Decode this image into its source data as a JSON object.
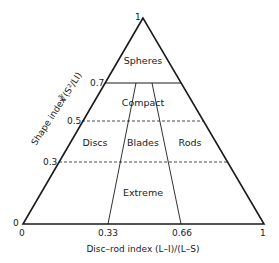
{
  "diagram": {
    "type": "ternary-form-diagram",
    "apex_label": "1",
    "origin_y_label": "0",
    "origin_x_label": "0",
    "y_axis": {
      "title": "Shape index",
      "formula": "∛(S²/LI)",
      "ticks": [
        {
          "value": 0.7,
          "label": "0.7",
          "style": "solid"
        },
        {
          "value": 0.5,
          "label": "0.5",
          "style": "dashed"
        },
        {
          "value": 0.3,
          "label": "0.3",
          "style": "dashed"
        }
      ]
    },
    "x_axis": {
      "title": "Disc–rod index (L–I)/(L–S)",
      "ticks": [
        {
          "value": 0,
          "label": "0"
        },
        {
          "value": 0.33,
          "label": "0.33"
        },
        {
          "value": 0.66,
          "label": "0.66"
        },
        {
          "value": 1,
          "label": "1"
        }
      ]
    },
    "regions": [
      {
        "name": "Spheres"
      },
      {
        "name": "Compact"
      },
      {
        "name": "Discs"
      },
      {
        "name": "Blades"
      },
      {
        "name": "Rods"
      },
      {
        "name": "Extreme"
      }
    ]
  }
}
